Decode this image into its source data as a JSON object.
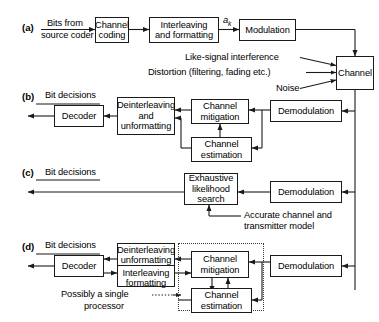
{
  "figure": {
    "panels": [
      {
        "tag": "(a)",
        "name": "transmitter-chain",
        "blocks": [
          {
            "id": "channel-coding",
            "lines": [
              "Channel",
              "coding"
            ]
          },
          {
            "id": "interleaving-formatting",
            "lines": [
              "Interleaving",
              "and formatting"
            ]
          },
          {
            "id": "modulation",
            "lines": [
              "Modulation"
            ]
          },
          {
            "id": "channel",
            "lines": [
              "Channel"
            ]
          }
        ],
        "labels": {
          "input": {
            "line1": "Bits from",
            "line2": "source coder"
          },
          "symbol": "a",
          "symbol_sub": "k",
          "impairment_1": "Like-signal interference",
          "impairment_2": "Distortion (filtering, fading etc.)",
          "impairment_3": "Noise"
        }
      },
      {
        "tag": "(b)",
        "name": "receiver-chain-conventional",
        "blocks": [
          {
            "id": "decoder-b",
            "lines": [
              "Decoder"
            ]
          },
          {
            "id": "deinterleaving-unformatting-b",
            "lines": [
              "Deinterleaving",
              "and",
              "unformatting"
            ]
          },
          {
            "id": "channel-mitigation-b",
            "lines": [
              "Channel",
              "mitigation"
            ]
          },
          {
            "id": "channel-estimation-b",
            "lines": [
              "Channel",
              "estimation"
            ]
          },
          {
            "id": "demodulation-b",
            "lines": [
              "Demodulation"
            ]
          }
        ],
        "labels": {
          "output": "Bit decisions"
        }
      },
      {
        "tag": "(c)",
        "name": "receiver-chain-exhaustive",
        "blocks": [
          {
            "id": "exhaustive-likelihood-search",
            "lines": [
              "Exhaustive",
              "likelihood",
              "search"
            ]
          },
          {
            "id": "demodulation-c",
            "lines": [
              "Demodulation"
            ]
          }
        ],
        "labels": {
          "output": "Bit decisions",
          "annotation_line1": "Accurate channel and",
          "annotation_line2": "transmitter model"
        }
      },
      {
        "tag": "(d)",
        "name": "receiver-chain-iterative",
        "blocks": [
          {
            "id": "decoder-d",
            "lines": [
              "Decoder"
            ]
          },
          {
            "id": "deinterleaving-unformatting-d",
            "lines": [
              "Deinterleaving",
              "unformatting"
            ]
          },
          {
            "id": "interleaving-formatting-d",
            "lines": [
              "Interleaving",
              "formatting"
            ]
          },
          {
            "id": "channel-mitigation-d",
            "lines": [
              "Channel",
              "mitigation"
            ]
          },
          {
            "id": "channel-estimation-d",
            "lines": [
              "Channel",
              "estimation"
            ]
          },
          {
            "id": "demodulation-d",
            "lines": [
              "Demodulation"
            ]
          }
        ],
        "labels": {
          "output": "Bit decisions",
          "annotation_line1": "Possibly a single",
          "annotation_line2": "processor"
        }
      }
    ]
  },
  "text": {
    "panel_a_tag": "(a)",
    "panel_b_tag": "(b)",
    "panel_c_tag": "(c)",
    "panel_d_tag": "(d)",
    "bits_from": "Bits from",
    "source_coder": "source coder",
    "channel_coding_1": "Channel",
    "channel_coding_2": "coding",
    "interleaving_1": "Interleaving",
    "interleaving_2": "and formatting",
    "ak_symbol": "a",
    "ak_sub": "k",
    "modulation": "Modulation",
    "channel": "Channel",
    "like_signal_interference": "Like-signal interference",
    "distortion": "Distortion (filtering, fading etc.)",
    "noise": "Noise",
    "bit_decisions_b": "Bit decisions",
    "decoder_b": "Decoder",
    "deint_b_1": "Deinterleaving",
    "deint_b_2": "and",
    "deint_b_3": "unformatting",
    "chan_mit_b_1": "Channel",
    "chan_mit_b_2": "mitigation",
    "chan_est_b_1": "Channel",
    "chan_est_b_2": "estimation",
    "demodulation_b": "Demodulation",
    "bit_decisions_c": "Bit decisions",
    "exh_c_1": "Exhaustive",
    "exh_c_2": "likelihood",
    "exh_c_3": "search",
    "demodulation_c": "Demodulation",
    "accurate_1": "Accurate channel and",
    "accurate_2": "transmitter model",
    "bit_decisions_d": "Bit decisions",
    "decoder_d": "Decoder",
    "deint_d_1": "Deinterleaving",
    "deint_d_2": "unformatting",
    "int_d_1": "Interleaving",
    "int_d_2": "formatting",
    "chan_mit_d_1": "Channel",
    "chan_mit_d_2": "mitigation",
    "chan_est_d_1": "Channel",
    "chan_est_d_2": "estimation",
    "demodulation_d": "Demodulation",
    "possibly_1": "Possibly a single",
    "possibly_2": "processor"
  },
  "colors": {
    "line": "#1a1a1a",
    "dashed": "#3a3a3a",
    "background": "#ffffff",
    "text": "#000000"
  }
}
